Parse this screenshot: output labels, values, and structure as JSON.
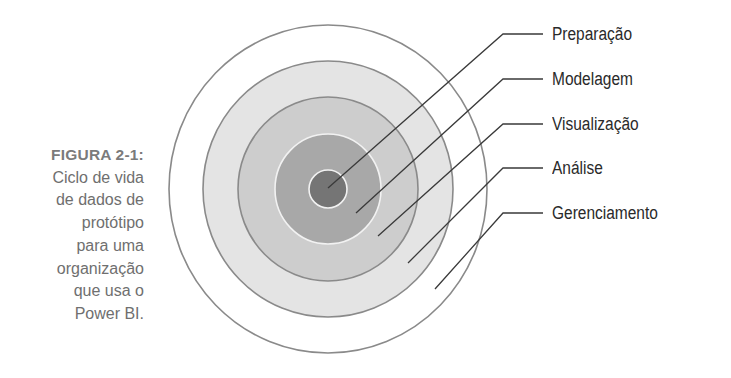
{
  "caption": {
    "title": "FIGURA 2-1:",
    "lines": [
      "Ciclo de vida",
      "de dados de",
      "protótipo",
      "para uma",
      "organização",
      "que usa o",
      "Power BI."
    ]
  },
  "diagram": {
    "type": "concentric-rings",
    "center": {
      "x": 328,
      "y": 189
    },
    "rings": [
      {
        "name": "Gerenciamento",
        "rx": 159,
        "ry": 164,
        "fill": "#ffffff",
        "stroke": "#8a8a8a"
      },
      {
        "name": "Análise",
        "rx": 125,
        "ry": 128,
        "fill": "#e4e4e4",
        "stroke": "#8a8a8a"
      },
      {
        "name": "Visualização",
        "rx": 90,
        "ry": 92,
        "fill": "#cdcdcd",
        "stroke": "#8a8a8a"
      },
      {
        "name": "Modelagem",
        "rx": 53,
        "ry": 55,
        "fill": "#a8a8a8",
        "stroke": "#f2f2f2"
      },
      {
        "name": "Preparação",
        "rx": 19,
        "ry": 19,
        "fill": "#757575",
        "stroke": "#f2f2f2"
      }
    ],
    "leader_color": "#3a3a3a"
  },
  "labels": [
    {
      "text": "Preparação",
      "y": 34,
      "end": {
        "x": 328,
        "y": 188
      }
    },
    {
      "text": "Modelagem",
      "y": 79,
      "end": {
        "x": 356,
        "y": 213
      }
    },
    {
      "text": "Visualização",
      "y": 124,
      "end": {
        "x": 378,
        "y": 236
      }
    },
    {
      "text": "Análise",
      "y": 168,
      "end": {
        "x": 408,
        "y": 263
      }
    },
    {
      "text": "Gerenciamento",
      "y": 213,
      "end": {
        "x": 435,
        "y": 289
      }
    }
  ]
}
